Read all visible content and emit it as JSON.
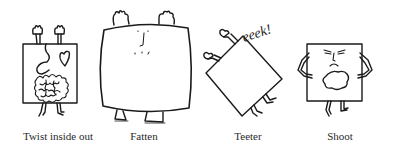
{
  "figures": [
    {
      "id": "twist",
      "label": "Twist inside out",
      "label_x": 58
    },
    {
      "id": "fatten",
      "label": "Fatten",
      "label_x": 144
    },
    {
      "id": "teeter",
      "label": "Teeter",
      "label_x": 248,
      "exclamation": "eeek!"
    },
    {
      "id": "shoot",
      "label": "Shoot",
      "label_x": 340
    }
  ],
  "colors": {
    "ink": "#1a1a1a",
    "background": "#ffffff",
    "label": "#2a2a2a"
  }
}
